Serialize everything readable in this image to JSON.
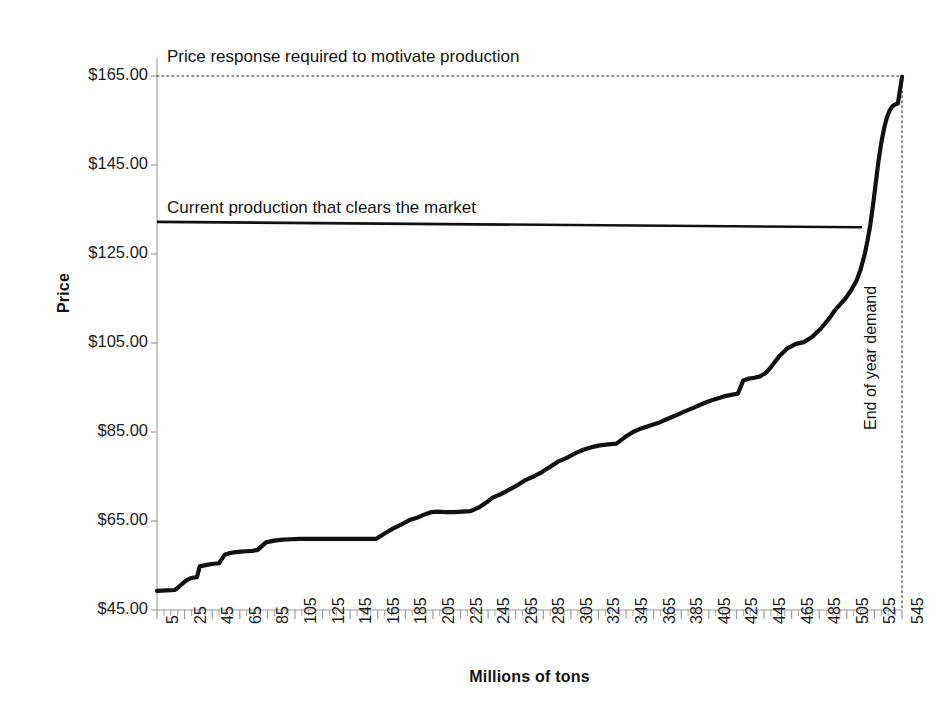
{
  "chart_data": {
    "type": "line",
    "title": "",
    "xlabel": "Millions of tons",
    "ylabel": "Price",
    "xlim": [
      5,
      545
    ],
    "ylim": [
      45,
      165
    ],
    "grid": false,
    "legend_position": "none",
    "y_tick_labels": [
      "$165.00",
      "$145.00",
      "$125.00",
      "$105.00",
      "$85.00",
      "$65.00",
      "$45.00"
    ],
    "y_tick_values": [
      165,
      145,
      125,
      105,
      85,
      65,
      45
    ],
    "x_tick_labels": [
      "5",
      "25",
      "45",
      "65",
      "85",
      "105",
      "125",
      "145",
      "165",
      "185",
      "205",
      "225",
      "245",
      "265",
      "285",
      "305",
      "325",
      "345",
      "365",
      "385",
      "405",
      "425",
      "445",
      "465",
      "485",
      "505",
      "525",
      "545"
    ],
    "x_tick_values": [
      5,
      25,
      45,
      65,
      85,
      105,
      125,
      145,
      165,
      185,
      205,
      225,
      245,
      265,
      285,
      305,
      325,
      345,
      365,
      385,
      405,
      425,
      445,
      465,
      485,
      505,
      525,
      545
    ],
    "series": [
      {
        "name": "Cost curve",
        "color": "#111111",
        "x": [
          5,
          12,
          18,
          20,
          26,
          30,
          34,
          36,
          42,
          46,
          50,
          54,
          58,
          62,
          66,
          70,
          74,
          78,
          84,
          90,
          96,
          102,
          108,
          114,
          120,
          128,
          136,
          146,
          156,
          164,
          170,
          176,
          182,
          188,
          194,
          200,
          204,
          208,
          214,
          220,
          226,
          232,
          238,
          244,
          248,
          254,
          260,
          266,
          272,
          278,
          284,
          290,
          296,
          302,
          308,
          314,
          320,
          326,
          332,
          338,
          344,
          350,
          356,
          362,
          368,
          374,
          380,
          386,
          392,
          398,
          404,
          410,
          416,
          422,
          426,
          430,
          434,
          438,
          442,
          446,
          450,
          456,
          462,
          468,
          474,
          480,
          486,
          492,
          496,
          500,
          504,
          508,
          512,
          515,
          518,
          520,
          522,
          524,
          526,
          528,
          530,
          532,
          534,
          536,
          538,
          540,
          542,
          545
        ],
        "y": [
          49.3,
          49.4,
          49.5,
          50.0,
          51.6,
          52.2,
          52.4,
          54.8,
          55.2,
          55.4,
          55.5,
          57.4,
          57.8,
          58.0,
          58.1,
          58.2,
          58.3,
          58.5,
          60.2,
          60.6,
          60.8,
          60.9,
          61.0,
          61.0,
          61.0,
          61.0,
          61.0,
          61.0,
          61.0,
          61.0,
          62.2,
          63.3,
          64.2,
          65.2,
          65.8,
          66.6,
          67.0,
          67.1,
          67.0,
          67.0,
          67.1,
          67.2,
          68.0,
          69.2,
          70.2,
          71.0,
          72.0,
          73.0,
          74.2,
          75.0,
          76.0,
          77.2,
          78.4,
          79.2,
          80.2,
          81.0,
          81.6,
          82.0,
          82.2,
          82.4,
          83.8,
          85.0,
          85.8,
          86.4,
          87.0,
          87.8,
          88.6,
          89.4,
          90.2,
          91.0,
          91.8,
          92.4,
          93.0,
          93.4,
          93.6,
          96.6,
          97.0,
          97.2,
          97.5,
          98.2,
          99.6,
          102.0,
          103.8,
          104.8,
          105.2,
          106.4,
          108.2,
          110.4,
          112.2,
          113.6,
          115.0,
          116.8,
          119.0,
          121.5,
          125.0,
          128.0,
          131.5,
          136.0,
          141.0,
          146.0,
          150.0,
          153.2,
          155.6,
          157.2,
          158.2,
          158.6,
          158.8,
          164.8
        ]
      }
    ],
    "annotations": [
      {
        "name": "price-response-line",
        "label": "Price response required to motivate production",
        "style": "dotted-horizontal",
        "y_value": 165,
        "x_from": 5,
        "x_to": 545
      },
      {
        "name": "current-production-line",
        "label": "Current production that clears the market",
        "style": "solid-horizontal",
        "y_value": 131.5,
        "x_from": 5,
        "x_to": 545
      },
      {
        "name": "end-of-year-demand-line",
        "label": "End of year demand",
        "style": "dotted-vertical",
        "x_value": 545,
        "y_from": 45,
        "y_to": 165
      }
    ]
  },
  "axis": {
    "y_title": "Price",
    "x_title": "Millions of tons"
  },
  "annotations": {
    "price_response": "Price response required to motivate production",
    "current_production": "Current production that clears the market",
    "end_of_year": "End of year demand"
  },
  "colors": {
    "curve": "#111111",
    "axis": "#9a9a9a",
    "text": "#1a1a1a",
    "background": "#ffffff"
  }
}
